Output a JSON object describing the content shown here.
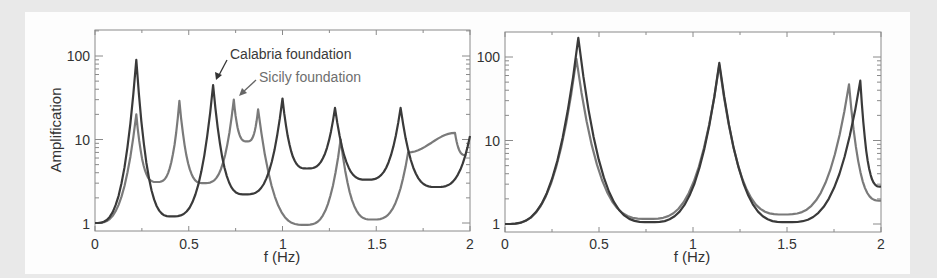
{
  "chart_data": [
    {
      "type": "line",
      "panel": "left",
      "title": "",
      "xlabel": "f (Hz)",
      "ylabel": "Amplification",
      "xlim": [
        0,
        2
      ],
      "ylim": [
        0.85,
        180
      ],
      "yscale": "log",
      "xticks": [
        "0",
        "0.5",
        "1",
        "1.5",
        "2"
      ],
      "yticks": [
        "1",
        "10",
        "100"
      ],
      "grid": false,
      "annotations": [
        "Calabria foundation",
        "Sicily foundation"
      ],
      "series": [
        {
          "name": "Calabria foundation",
          "color": "#3a3a3a",
          "peaks": [
            {
              "f": 0.22,
              "amp": 90
            },
            {
              "f": 0.63,
              "amp": 45
            },
            {
              "f": 1.0,
              "amp": 31
            },
            {
              "f": 1.28,
              "amp": 24
            },
            {
              "f": 1.63,
              "amp": 24
            },
            {
              "f": 2.0,
              "amp": 11
            }
          ],
          "troughs": [
            {
              "f": 0.0,
              "amp": 1.0
            },
            {
              "f": 0.41,
              "amp": 1.2
            },
            {
              "f": 0.8,
              "amp": 2.2
            },
            {
              "f": 1.13,
              "amp": 4.5
            },
            {
              "f": 1.45,
              "amp": 3.3
            },
            {
              "f": 1.82,
              "amp": 2.7
            }
          ]
        },
        {
          "name": "Sicily foundation",
          "color": "#7a7a7a",
          "peaks": [
            {
              "f": 0.22,
              "amp": 20
            },
            {
              "f": 0.45,
              "amp": 29
            },
            {
              "f": 0.74,
              "amp": 30
            },
            {
              "f": 0.87,
              "amp": 23
            },
            {
              "f": 1.31,
              "amp": 10
            },
            {
              "f": 1.67,
              "amp": 7
            },
            {
              "f": 1.92,
              "amp": 12
            }
          ],
          "troughs": [
            {
              "f": 0.0,
              "amp": 1.0
            },
            {
              "f": 0.33,
              "amp": 3.1
            },
            {
              "f": 0.58,
              "amp": 3.0
            },
            {
              "f": 0.81,
              "amp": 9.5
            },
            {
              "f": 1.12,
              "amp": 0.95
            },
            {
              "f": 1.48,
              "amp": 1.1
            },
            {
              "f": 1.98,
              "amp": 6.5
            }
          ]
        }
      ]
    },
    {
      "type": "line",
      "panel": "right",
      "title": "",
      "xlabel": "f (Hz)",
      "ylabel": "",
      "xlim": [
        0,
        2
      ],
      "ylim": [
        0.85,
        180
      ],
      "yscale": "log",
      "xticks": [
        "0",
        "0.5",
        "1",
        "1.5",
        "2"
      ],
      "yticks": [
        "1",
        "10",
        "100"
      ],
      "grid": false,
      "series": [
        {
          "name": "Calabria foundation",
          "color": "#3a3a3a",
          "peaks": [
            {
              "f": 0.39,
              "amp": 170
            },
            {
              "f": 1.14,
              "amp": 85
            },
            {
              "f": 1.89,
              "amp": 52
            }
          ],
          "troughs": [
            {
              "f": 0.0,
              "amp": 1.0
            },
            {
              "f": 0.77,
              "amp": 1.05
            },
            {
              "f": 1.5,
              "amp": 1.05
            },
            {
              "f": 2.0,
              "amp": 2.8
            }
          ]
        },
        {
          "name": "Sicily foundation",
          "color": "#7a7a7a",
          "peaks": [
            {
              "f": 0.38,
              "amp": 95
            },
            {
              "f": 1.14,
              "amp": 80
            },
            {
              "f": 1.83,
              "amp": 47
            }
          ],
          "troughs": [
            {
              "f": 0.0,
              "amp": 1.0
            },
            {
              "f": 0.76,
              "amp": 1.15
            },
            {
              "f": 1.48,
              "amp": 1.3
            },
            {
              "f": 2.0,
              "amp": 1.9
            }
          ]
        }
      ]
    }
  ],
  "labels": {
    "left_xlabel": "f (Hz)",
    "right_xlabel": "f (Hz)",
    "left_ylabel": "Amplification",
    "calabria": "Calabria foundation",
    "sicily": "Sicily foundation",
    "xticks": [
      "0",
      "0.5",
      "1",
      "1.5",
      "2"
    ],
    "yticks": [
      "1",
      "10",
      "100"
    ]
  }
}
